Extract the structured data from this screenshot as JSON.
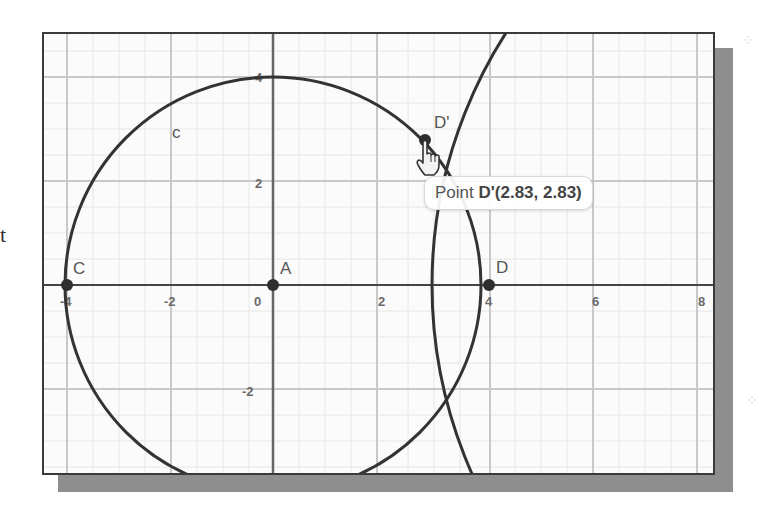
{
  "side_text": "t",
  "graph": {
    "x_ticks": [
      "-4",
      "-2",
      "0",
      "2",
      "4",
      "6",
      "8"
    ],
    "y_ticks": [
      "4",
      "2",
      "-2"
    ],
    "circle_label": "c",
    "points": [
      {
        "name": "C",
        "x": -4,
        "y": 0
      },
      {
        "name": "A",
        "x": 0,
        "y": 0
      },
      {
        "name": "D",
        "x": 4,
        "y": 0
      },
      {
        "name": "D'",
        "x": 2.83,
        "y": 2.83
      }
    ],
    "colors": {
      "curve": "#333333",
      "grid_major": "#c8c8c8",
      "grid_minor": "#e6e6e6",
      "axis": "#444444",
      "shadow": "#8e8e8e"
    }
  },
  "tooltip": {
    "prefix": "Point ",
    "bold_text": "D'(2.83, 2.83)"
  }
}
